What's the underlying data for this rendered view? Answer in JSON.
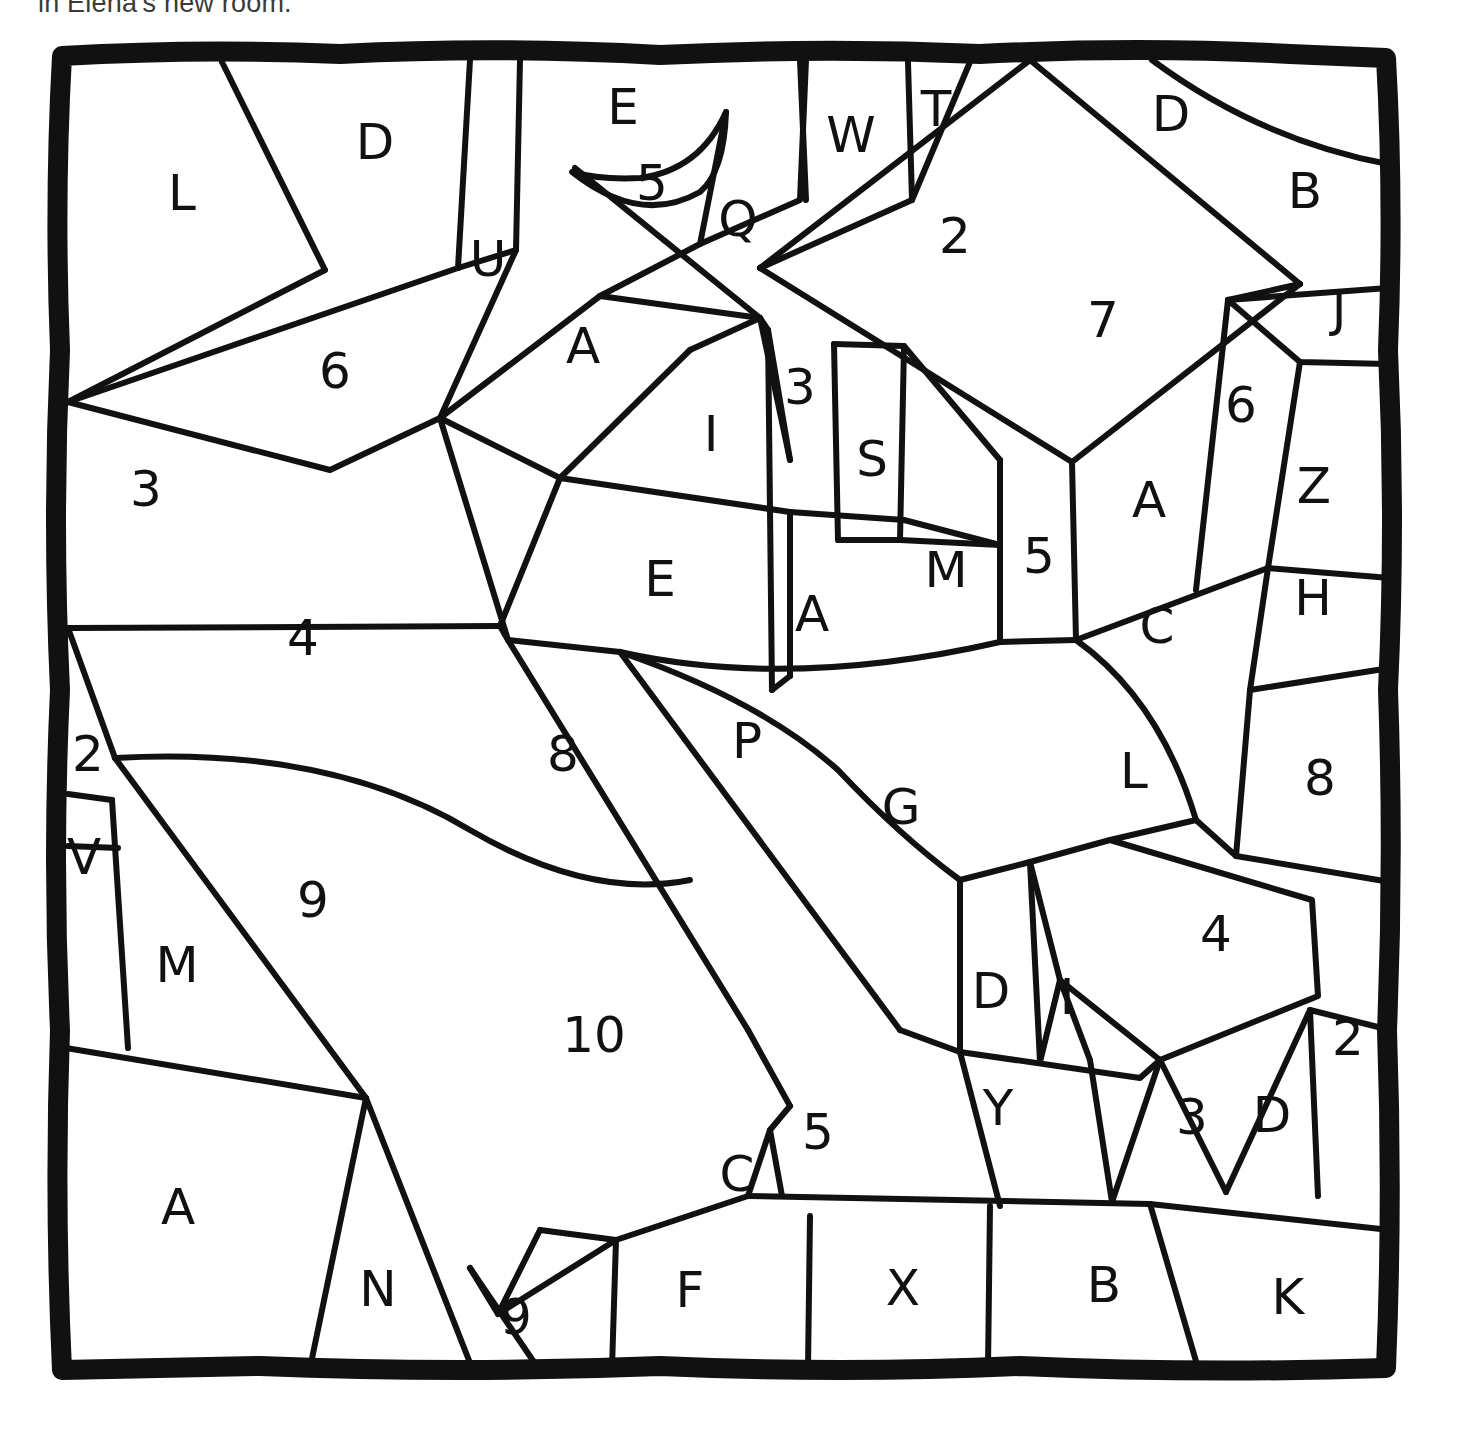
{
  "caption": {
    "text": "in Elena's new room."
  },
  "puzzle": {
    "type": "color-by-number-letter-mosaic",
    "style": "hand-drawn black outline on white",
    "frame": {
      "stroke_color": "#111111",
      "x": 60,
      "y": 52,
      "width": 1330,
      "height": 1318
    },
    "line_color": "#111111",
    "background_color": "#ffffff",
    "region_count": 58,
    "labels_summary": {
      "letters": [
        "L",
        "D",
        "U",
        "E",
        "Q",
        "W",
        "T",
        "D",
        "B",
        "A",
        "I",
        "S",
        "J",
        "Z",
        "A",
        "E",
        "A",
        "M",
        "C",
        "H",
        "P",
        "G",
        "L",
        "V",
        "M",
        "D",
        "I",
        "Y",
        "D",
        "C",
        "A",
        "N",
        "F",
        "X",
        "B",
        "K"
      ],
      "numbers": [
        "5",
        "2",
        "3",
        "6",
        "7",
        "6",
        "3",
        "5",
        "4",
        "8",
        "9",
        "2",
        "10",
        "5",
        "4",
        "3",
        "2",
        "8",
        "9"
      ]
    },
    "regions": [
      {
        "id": "r-L",
        "label": "L",
        "x": 182,
        "y": 196
      },
      {
        "id": "r-D1",
        "label": "D",
        "x": 375,
        "y": 145
      },
      {
        "id": "r-6a",
        "label": "6",
        "x": 335,
        "y": 374
      },
      {
        "id": "r-U",
        "label": "U",
        "x": 488,
        "y": 262
      },
      {
        "id": "r-E1",
        "label": "E",
        "x": 623,
        "y": 110
      },
      {
        "id": "r-5a",
        "label": "5",
        "x": 652,
        "y": 186
      },
      {
        "id": "r-Q",
        "label": "Q",
        "x": 738,
        "y": 222
      },
      {
        "id": "r-W",
        "label": "W",
        "x": 851,
        "y": 138
      },
      {
        "id": "r-T",
        "label": "T",
        "x": 936,
        "y": 112
      },
      {
        "id": "r-D2",
        "label": "D",
        "x": 1171,
        "y": 117
      },
      {
        "id": "r-B1",
        "label": "B",
        "x": 1305,
        "y": 194
      },
      {
        "id": "r-2a",
        "label": "2",
        "x": 955,
        "y": 239
      },
      {
        "id": "r-7",
        "label": "7",
        "x": 1103,
        "y": 323
      },
      {
        "id": "r-J",
        "label": "J",
        "x": 1339,
        "y": 312
      },
      {
        "id": "r-A1",
        "label": "A",
        "x": 583,
        "y": 349
      },
      {
        "id": "r-3a",
        "label": "3",
        "x": 800,
        "y": 390
      },
      {
        "id": "r-I",
        "label": "I",
        "x": 711,
        "y": 437
      },
      {
        "id": "r-S",
        "label": "S",
        "x": 872,
        "y": 462
      },
      {
        "id": "r-6b",
        "label": "6",
        "x": 1241,
        "y": 408
      },
      {
        "id": "r-A2",
        "label": "A",
        "x": 1149,
        "y": 503
      },
      {
        "id": "r-Z",
        "label": "Z",
        "x": 1314,
        "y": 489
      },
      {
        "id": "r-3b",
        "label": "3",
        "x": 146,
        "y": 492
      },
      {
        "id": "r-E2",
        "label": "E",
        "x": 660,
        "y": 582
      },
      {
        "id": "r-A3",
        "label": "A",
        "x": 812,
        "y": 617
      },
      {
        "id": "r-M1",
        "label": "M",
        "x": 946,
        "y": 573
      },
      {
        "id": "r-5b",
        "label": "5",
        "x": 1039,
        "y": 559
      },
      {
        "id": "r-C1",
        "label": "C",
        "x": 1157,
        "y": 629
      },
      {
        "id": "r-H",
        "label": "H",
        "x": 1313,
        "y": 601
      },
      {
        "id": "r-4a",
        "label": "4",
        "x": 303,
        "y": 641
      },
      {
        "id": "r-8a",
        "label": "8",
        "x": 563,
        "y": 757
      },
      {
        "id": "r-P",
        "label": "P",
        "x": 747,
        "y": 744
      },
      {
        "id": "r-G",
        "label": "G",
        "x": 901,
        "y": 810
      },
      {
        "id": "r-L2",
        "label": "L",
        "x": 1134,
        "y": 774
      },
      {
        "id": "r-8b",
        "label": "8",
        "x": 1320,
        "y": 781
      },
      {
        "id": "r-2b",
        "label": "2",
        "x": 88,
        "y": 757
      },
      {
        "id": "r-V",
        "label": "V",
        "x": 84,
        "y": 860
      },
      {
        "id": "r-9a",
        "label": "9",
        "x": 313,
        "y": 903
      },
      {
        "id": "r-M2",
        "label": "M",
        "x": 177,
        "y": 968
      },
      {
        "id": "r-4b",
        "label": "4",
        "x": 1216,
        "y": 937
      },
      {
        "id": "r-D3",
        "label": "D",
        "x": 991,
        "y": 994
      },
      {
        "id": "r-I2",
        "label": "I",
        "x": 1067,
        "y": 1000
      },
      {
        "id": "r-10",
        "label": "10",
        "x": 594,
        "y": 1038
      },
      {
        "id": "r-2c",
        "label": "2",
        "x": 1348,
        "y": 1041
      },
      {
        "id": "r-Y",
        "label": "Y",
        "x": 998,
        "y": 1111
      },
      {
        "id": "r-3c",
        "label": "3",
        "x": 1192,
        "y": 1120
      },
      {
        "id": "r-D4",
        "label": "D",
        "x": 1272,
        "y": 1118
      },
      {
        "id": "r-5c",
        "label": "5",
        "x": 818,
        "y": 1135
      },
      {
        "id": "r-C2",
        "label": "C",
        "x": 737,
        "y": 1177
      },
      {
        "id": "r-A4",
        "label": "A",
        "x": 178,
        "y": 1210
      },
      {
        "id": "r-N",
        "label": "N",
        "x": 378,
        "y": 1292
      },
      {
        "id": "r-9b",
        "label": "9",
        "x": 516,
        "y": 1320
      },
      {
        "id": "r-F",
        "label": "F",
        "x": 690,
        "y": 1293
      },
      {
        "id": "r-X",
        "label": "X",
        "x": 903,
        "y": 1291
      },
      {
        "id": "r-B2",
        "label": "B",
        "x": 1104,
        "y": 1288
      },
      {
        "id": "r-K",
        "label": "K",
        "x": 1288,
        "y": 1300
      }
    ]
  }
}
